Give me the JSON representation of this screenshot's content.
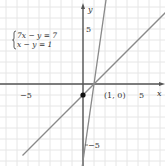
{
  "chart_data": {
    "type": "line",
    "title": "",
    "xlabel": "x",
    "ylabel": "y",
    "xlim": [
      -7.5,
      7.5
    ],
    "ylim": [
      -7.5,
      7.5
    ],
    "grid": true,
    "x_tick_labels": [
      "-5",
      "5"
    ],
    "y_tick_labels": [
      "5",
      "-5"
    ],
    "system_of_equations": [
      "7x − y = 7",
      "x − y = 1"
    ],
    "series": [
      {
        "name": "7x − y = 7",
        "equation": "y = 7x − 7",
        "slope": 7,
        "intercept": -7
      },
      {
        "name": "x − y = 1",
        "equation": "y = x − 1",
        "slope": 1,
        "intercept": -1
      }
    ],
    "points": [
      {
        "label": "(1, 0)",
        "x": 1,
        "y": 0,
        "marker": "none"
      },
      {
        "label": "",
        "x": 0,
        "y": -1,
        "marker": "filled-dot"
      }
    ],
    "annotations": [
      "(1, 0)"
    ]
  },
  "labels": {
    "x_axis": "x",
    "y_axis": "y",
    "x_neg5": "−5",
    "x_pos5": "5",
    "y_pos5": "5",
    "y_neg5": "−5",
    "point_1_0": "(1, 0)",
    "eq1": "7x − y = 7",
    "eq2": "x − y = 1"
  },
  "colors": {
    "grid": "#e6e6e6",
    "axis": "#555555",
    "lines": "#8a8a8a",
    "dot": "#111111"
  }
}
